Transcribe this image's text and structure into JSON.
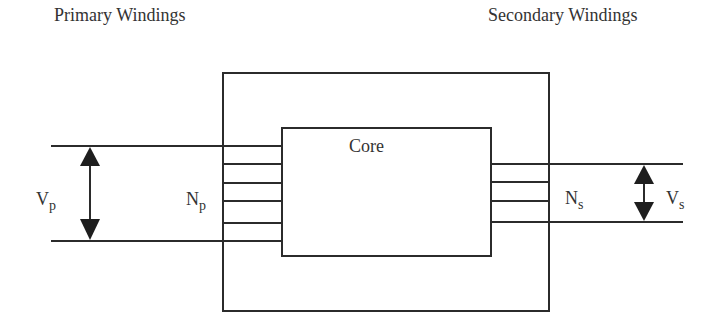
{
  "diagram": {
    "type": "transformer-schematic",
    "labels": {
      "primary_heading": "Primary Windings",
      "secondary_heading": "Secondary Windings",
      "core": "Core",
      "primary_voltage": {
        "main": "V",
        "sub": "p"
      },
      "secondary_voltage": {
        "main": "V",
        "sub": "s"
      },
      "primary_turns": {
        "main": "N",
        "sub": "p"
      },
      "secondary_turns": {
        "main": "N",
        "sub": "s"
      }
    },
    "colors": {
      "line": "#2b2b2b",
      "text": "#333333",
      "background": "#ffffff"
    },
    "primary_winding_count": 6,
    "secondary_winding_count": 4
  }
}
